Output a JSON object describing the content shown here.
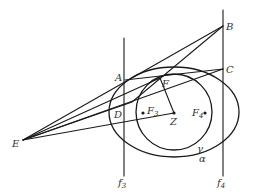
{
  "diagram": {
    "type": "geometry",
    "points": {
      "A": {
        "label": "A",
        "x": 125,
        "y": 80
      },
      "B": {
        "label": "B",
        "x": 223,
        "y": 26
      },
      "C": {
        "label": "C",
        "x": 223,
        "y": 69
      },
      "D": {
        "label": "D",
        "x": 125,
        "y": 115
      },
      "E": {
        "label": "E",
        "x": 23,
        "y": 140
      },
      "F": {
        "label": "F",
        "x": 160,
        "y": 78
      },
      "Z": {
        "label": "Z",
        "x": 174,
        "y": 113
      },
      "F3": {
        "label": "F",
        "sub": "3",
        "x": 143,
        "y": 113
      },
      "F4": {
        "label": "F",
        "sub": "4",
        "x": 205,
        "y": 113
      }
    },
    "curves": {
      "gamma": {
        "label": "γ",
        "type": "circle",
        "cx": 174,
        "cy": 112,
        "r": 38
      },
      "alpha": {
        "label": "α",
        "type": "ellipse",
        "cx": 174,
        "cy": 112,
        "rx": 65,
        "ry": 45
      }
    },
    "lines": {
      "f3": {
        "label": "f",
        "sub": "3",
        "x": 124,
        "y1": 38,
        "y2": 176
      },
      "f4": {
        "label": "f",
        "sub": "4",
        "x": 223,
        "y1": 10,
        "y2": 176
      }
    }
  }
}
